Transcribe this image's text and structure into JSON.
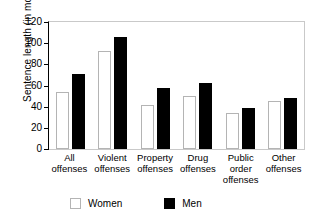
{
  "chart_data": {
    "type": "bar",
    "title": "",
    "xlabel": "",
    "ylabel": "Sentence length (in months)",
    "ylim": [
      0,
      120
    ],
    "yticks": [
      0,
      20,
      40,
      60,
      80,
      100,
      120
    ],
    "grid": false,
    "legend_position": "bottom",
    "categories": [
      "All offenses",
      "Violent offenses",
      "Property offenses",
      "Drug offenses",
      "Public order offenses",
      "Other offenses"
    ],
    "category_lines": [
      [
        "All",
        "offenses"
      ],
      [
        "Violent",
        "offenses"
      ],
      [
        "Property",
        "offenses"
      ],
      [
        "Drug",
        "offenses"
      ],
      [
        "Public",
        "order",
        "offenses"
      ],
      [
        "Other",
        "offenses"
      ]
    ],
    "series": [
      {
        "name": "Women",
        "color": "#ffffff",
        "edge_color": "#b4b4b4",
        "values": [
          54,
          93,
          42,
          50,
          34,
          45
        ]
      },
      {
        "name": "Men",
        "color": "#000000",
        "edge_color": "#000000",
        "values": [
          71,
          106,
          58,
          62,
          39,
          48
        ]
      }
    ]
  },
  "legend": {
    "items": [
      {
        "label": "Women",
        "swatch": "white-square-swatch"
      },
      {
        "label": "Men",
        "swatch": "black-square-swatch"
      }
    ]
  },
  "axis": {
    "y_tick_labels": [
      "120",
      "100",
      "80",
      "60",
      "40",
      "20",
      "0"
    ]
  }
}
